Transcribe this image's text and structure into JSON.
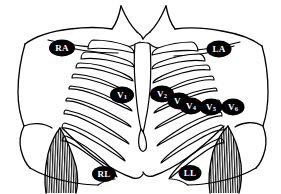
{
  "diagram": {
    "style": "black and white line drawing",
    "background_color": "#ffffff",
    "line_color": "#000000",
    "marker_fill_color": "#000000",
    "marker_text_color": "#ffffff",
    "width": 281,
    "height": 194
  },
  "electrodes": [
    {
      "id": "RA",
      "label": "RA",
      "name": "Right Arm",
      "group": "limb",
      "base": "RA",
      "subscript": "",
      "x": 62,
      "y": 48,
      "rx": 13,
      "ry": 8.5
    },
    {
      "id": "LA",
      "label": "LA",
      "name": "Left Arm",
      "group": "limb",
      "base": "LA",
      "subscript": "",
      "x": 219,
      "y": 49,
      "rx": 12.5,
      "ry": 8.5
    },
    {
      "id": "V1",
      "label": "V1",
      "name": "Precordial lead V1",
      "group": "precordial",
      "base": "V",
      "subscript": "1",
      "x": 122,
      "y": 95,
      "rx": 12,
      "ry": 8.5
    },
    {
      "id": "V2",
      "label": "V2",
      "name": "Precordial lead V2",
      "group": "precordial",
      "base": "V",
      "subscript": "2",
      "x": 162,
      "y": 94,
      "rx": 12,
      "ry": 8.5
    },
    {
      "id": "V3",
      "label": "V3",
      "name": "Precordial lead V3",
      "group": "precordial",
      "base": "V",
      "subscript": "3",
      "x": 179,
      "y": 101,
      "rx": 11.5,
      "ry": 8.5
    },
    {
      "id": "V4",
      "label": "V4",
      "name": "Precordial lead V4",
      "group": "precordial",
      "base": "V",
      "subscript": "4",
      "x": 191,
      "y": 106,
      "rx": 11.5,
      "ry": 8.5
    },
    {
      "id": "V5",
      "label": "V5",
      "name": "Precordial lead V5",
      "group": "precordial",
      "base": "V",
      "subscript": "5",
      "x": 211,
      "y": 107,
      "rx": 11.5,
      "ry": 8.5
    },
    {
      "id": "V6",
      "label": "V6",
      "name": "Precordial lead V6",
      "group": "precordial",
      "base": "V",
      "subscript": "6",
      "x": 233,
      "y": 107,
      "rx": 11.5,
      "ry": 8.5
    },
    {
      "id": "RL",
      "label": "RL",
      "name": "Right Leg",
      "group": "limb",
      "base": "RL",
      "subscript": "",
      "x": 104,
      "y": 174,
      "rx": 12,
      "ry": 8
    },
    {
      "id": "LL",
      "label": "LL",
      "name": "Left Leg",
      "group": "limb",
      "base": "LL",
      "subscript": "",
      "x": 190,
      "y": 173,
      "rx": 11.5,
      "ry": 8
    }
  ],
  "anatomy": {
    "regions": [
      "neck",
      "left-clavicle",
      "right-clavicle",
      "left-shoulder",
      "right-shoulder",
      "sternum",
      "xiphoid-process",
      "left-rib-cage",
      "right-rib-cage",
      "left-arm-hatched",
      "right-arm-hatched",
      "abdomen"
    ]
  }
}
